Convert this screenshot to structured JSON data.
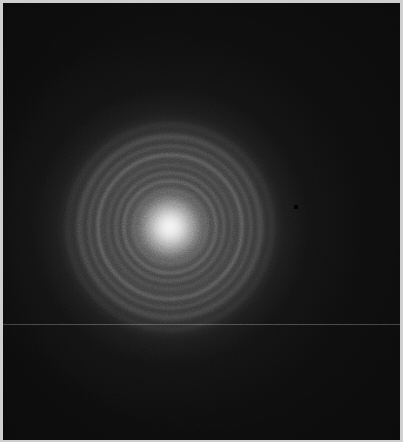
{
  "image": {
    "kind": "electron-diffraction-pattern",
    "description": "Debye-Scherrer ring diffraction pattern with bright central transmitted beam",
    "width_px": 403,
    "height_px": 442,
    "frame_color": "#cfcfcf",
    "plate_background_color": "#0d0d0d",
    "beam_color": "#ffffff"
  },
  "geometry": {
    "center_x_px": 170,
    "center_y_px": 227,
    "central_beam_radius_px": 26,
    "diffuse_halo_outer_radius_px": 105
  },
  "chart_data": {
    "type": "scatter",
    "title": "",
    "subtitle": "",
    "xlabel": "",
    "ylabel": "",
    "grid": false,
    "legend_position": "none",
    "center": {
      "x": 170,
      "y": 227
    },
    "rings": [
      {
        "index": 1,
        "radius_px": 38,
        "intensity": 0.14,
        "thickness_px": 2,
        "note": "innermost faint arc"
      },
      {
        "index": 2,
        "radius_px": 47,
        "intensity": 0.3,
        "thickness_px": 2,
        "note": "sharp bright ring"
      },
      {
        "index": 3,
        "radius_px": 55,
        "intensity": 0.22,
        "thickness_px": 2,
        "note": "sharp ring, close pair with ring 2"
      },
      {
        "index": 4,
        "radius_px": 63,
        "intensity": 0.12,
        "thickness_px": 2,
        "note": "faint"
      },
      {
        "index": 5,
        "radius_px": 73,
        "intensity": 0.26,
        "thickness_px": 2,
        "note": "bright outer ring"
      },
      {
        "index": 6,
        "radius_px": 82,
        "intensity": 0.14,
        "thickness_px": 2,
        "note": "faint companion"
      },
      {
        "index": 7,
        "radius_px": 92,
        "intensity": 0.18,
        "thickness_px": 3,
        "note": "broad outermost ring"
      },
      {
        "index": 8,
        "radius_px": 104,
        "intensity": 0.07,
        "thickness_px": 3,
        "note": "very faint halo edge"
      }
    ],
    "central_beam": {
      "radius_px": 26,
      "peak_intensity": 1.0,
      "falloff": "gaussian"
    },
    "background_intensity": 0.05,
    "xlim": [
      0,
      403
    ],
    "ylim": [
      0,
      442
    ]
  },
  "artifacts": {
    "scan_line": {
      "y_px": 324,
      "intensity": 0.3,
      "orientation": "horizontal"
    },
    "pixel_defect": {
      "x_px": 294,
      "y_px": 205,
      "size_px": 4,
      "type": "dead-pixel"
    }
  }
}
